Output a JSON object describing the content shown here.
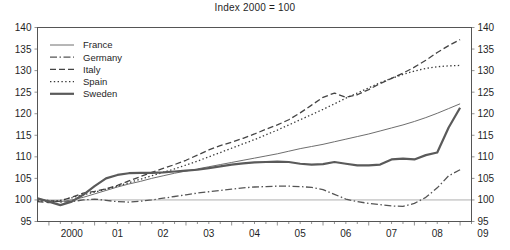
{
  "chart_data": {
    "type": "line",
    "title": "Index 2000 = 100",
    "xlabel": "",
    "ylabel": "",
    "ylim": [
      95,
      140
    ],
    "ytick_step": 5,
    "yticks": [
      95,
      100,
      105,
      110,
      115,
      120,
      125,
      130,
      135,
      140
    ],
    "ytick_labels": [
      "95",
      "100",
      "105",
      "110",
      "115",
      "120",
      "125",
      "130",
      "135",
      "140"
    ],
    "right_axis": true,
    "right_ytick_labels": [
      "95",
      "100",
      "105",
      "110",
      "115",
      "120",
      "125",
      "130",
      "135",
      "140"
    ],
    "xlim": [
      1999.75,
      2009.25
    ],
    "xticks": [
      2000,
      2001,
      2002,
      2003,
      2004,
      2005,
      2006,
      2007,
      2008,
      2009
    ],
    "xtick_labels": [
      "2000",
      "01",
      "02",
      "03",
      "04",
      "05",
      "06",
      "07",
      "08",
      "09"
    ],
    "minor_xticks_per_year": 4,
    "grid": false,
    "baseline_value": 100,
    "legend_position": "top-left-inside",
    "x": [
      1999.75,
      2000.0,
      2000.25,
      2000.5,
      2000.75,
      2001.0,
      2001.25,
      2001.5,
      2001.75,
      2002.0,
      2002.25,
      2002.5,
      2002.75,
      2003.0,
      2003.25,
      2003.5,
      2003.75,
      2004.0,
      2004.25,
      2004.5,
      2004.75,
      2005.0,
      2005.25,
      2005.5,
      2005.75,
      2006.0,
      2006.25,
      2006.5,
      2006.75,
      2007.0,
      2007.25,
      2007.5,
      2007.75,
      2008.0,
      2008.25,
      2008.5,
      2008.75,
      2009.0
    ],
    "series": [
      {
        "name": "France",
        "style": "solid-thin",
        "color": "#6e6e6e",
        "values": [
          100.0,
          99.8,
          99.6,
          100.0,
          100.6,
          101.4,
          102.2,
          103.0,
          103.7,
          104.3,
          105.0,
          105.6,
          106.2,
          106.7,
          107.2,
          107.7,
          108.2,
          108.7,
          109.2,
          109.7,
          110.2,
          110.7,
          111.3,
          111.9,
          112.4,
          112.9,
          113.5,
          114.1,
          114.7,
          115.3,
          116.0,
          116.7,
          117.4,
          118.2,
          119.1,
          120.1,
          121.2,
          122.3
        ]
      },
      {
        "name": "Germany",
        "style": "dash-dot",
        "color": "#555555",
        "values": [
          100.2,
          99.9,
          99.5,
          99.6,
          100.0,
          100.2,
          99.9,
          99.6,
          99.5,
          99.7,
          100.0,
          100.4,
          100.8,
          101.2,
          101.6,
          101.9,
          102.2,
          102.5,
          102.8,
          103.0,
          103.1,
          103.2,
          103.2,
          103.1,
          102.9,
          102.4,
          101.3,
          100.2,
          99.6,
          99.2,
          98.9,
          98.6,
          98.5,
          99.2,
          100.6,
          102.8,
          105.6,
          107.0
        ]
      },
      {
        "name": "Italy",
        "style": "dashed",
        "color": "#444444",
        "values": [
          99.6,
          99.4,
          99.8,
          100.6,
          101.6,
          102.0,
          102.6,
          103.4,
          104.4,
          105.4,
          106.4,
          107.3,
          108.2,
          109.2,
          110.4,
          111.6,
          112.6,
          113.4,
          114.3,
          115.3,
          116.4,
          117.4,
          118.6,
          120.2,
          122.0,
          123.8,
          124.8,
          123.8,
          124.4,
          125.6,
          127.0,
          128.2,
          129.4,
          130.8,
          132.4,
          134.2,
          135.8,
          137.2
        ]
      },
      {
        "name": "Spain",
        "style": "dotted",
        "color": "#3a3a3a",
        "values": [
          99.8,
          99.6,
          99.9,
          100.5,
          101.2,
          101.8,
          102.5,
          103.2,
          104.0,
          104.8,
          105.6,
          106.4,
          107.2,
          108.1,
          109.0,
          110.0,
          111.0,
          112.0,
          113.0,
          114.0,
          115.1,
          116.2,
          117.4,
          118.6,
          119.8,
          121.0,
          122.3,
          123.6,
          124.8,
          126.0,
          127.2,
          128.2,
          129.1,
          129.9,
          130.5,
          130.9,
          131.1,
          131.2
        ]
      },
      {
        "name": "Sweden",
        "style": "solid-thick",
        "color": "#5a5a5a",
        "values": [
          100.4,
          99.6,
          98.8,
          99.6,
          101.2,
          103.2,
          105.0,
          105.8,
          106.2,
          106.3,
          106.3,
          106.4,
          106.6,
          106.8,
          107.0,
          107.4,
          107.8,
          108.2,
          108.5,
          108.7,
          108.8,
          108.9,
          108.8,
          108.4,
          108.2,
          108.3,
          108.8,
          108.4,
          108.0,
          108.0,
          108.2,
          109.4,
          109.6,
          109.4,
          110.4,
          111.0,
          116.8,
          121.4
        ]
      }
    ]
  },
  "legend": {
    "entries": [
      {
        "label": "France"
      },
      {
        "label": "Germany"
      },
      {
        "label": "Italy"
      },
      {
        "label": "Spain"
      },
      {
        "label": "Sweden"
      }
    ]
  }
}
